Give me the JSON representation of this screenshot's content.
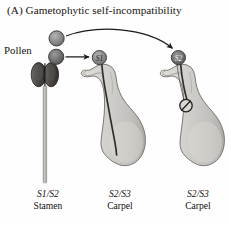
{
  "figure": {
    "panel_letter": "(A)",
    "title": "Gametophytic self-incompatibility",
    "full_title": "(A)  Gametophytic self-incompatibility"
  },
  "labels": {
    "pollen": "Pollen"
  },
  "pollen_grains": [
    {
      "name": "pollen-grain-upper",
      "allele": "",
      "color": "#8d8d8d"
    },
    {
      "name": "pollen-grain-lower",
      "allele": "",
      "color": "#6f6f6f"
    }
  ],
  "structures": [
    {
      "id": "stamen",
      "genotype": "S1/S2",
      "organ": "Stamen",
      "anther_color": "#4a4745",
      "filament_color": "#b9b7b4"
    },
    {
      "id": "carpel-compatible",
      "genotype": "S2/S3",
      "organ": "Carpel",
      "pollen_allele": "S1",
      "body_color": "#cfcdc9",
      "tube_outcome": "grows-to-ovary",
      "tube_blocked": false
    },
    {
      "id": "carpel-incompatible",
      "genotype": "S2/S3",
      "organ": "Carpel",
      "pollen_allele": "S2",
      "body_color": "#cfcdc9",
      "tube_outcome": "arrested-in-style",
      "tube_blocked": true
    }
  ],
  "symbols": {
    "blocked": "circle-slash"
  },
  "colors": {
    "ink": "#17120f",
    "outline": "#5b5855",
    "pollen_mid": "#8d8d8d",
    "pollen_dark": "#6f6f6f",
    "tissue": "#cfcdc9",
    "tissue_shadow": "#a8a5a1",
    "anther": "#4a4745",
    "tube": "#36322f",
    "background": "#fefefe"
  }
}
